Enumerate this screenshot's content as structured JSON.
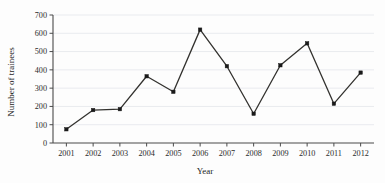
{
  "chart_data": {
    "type": "line",
    "title": "",
    "xlabel": "Year",
    "ylabel": "Number of trainees",
    "categories": [
      "2001",
      "2002",
      "2003",
      "2004",
      "2005",
      "2006",
      "2007",
      "2008",
      "2009",
      "2010",
      "2011",
      "2012"
    ],
    "x": [
      2001,
      2002,
      2003,
      2004,
      2005,
      2006,
      2007,
      2008,
      2009,
      2010,
      2011,
      2012
    ],
    "values": [
      75,
      180,
      185,
      365,
      280,
      620,
      420,
      160,
      425,
      545,
      215,
      385
    ],
    "series": [
      {
        "name": "Number of trainees",
        "values": [
          75,
          180,
          185,
          365,
          280,
          620,
          420,
          160,
          425,
          545,
          215,
          385
        ]
      }
    ],
    "ylim": [
      0,
      700
    ],
    "ytick_labels": [
      "0",
      "100",
      "200",
      "300",
      "400",
      "500",
      "600",
      "700"
    ],
    "yticks": [
      0,
      100,
      200,
      300,
      400,
      500,
      600,
      700
    ],
    "xtick_labels": [
      "2001",
      "2002",
      "2003",
      "2004",
      "2005",
      "2006",
      "2007",
      "2008",
      "2009",
      "2010",
      "2011",
      "2012"
    ],
    "grid": true,
    "grid_axis": "y",
    "legend": false,
    "legend_position": "none",
    "marker": "filled-square",
    "line_color": "#33322f",
    "marker_color": "#1a1a1a",
    "grid_color": "#dfe3e8",
    "axis_color": "#4a4a4a",
    "background_color": "#fdfdfd"
  }
}
